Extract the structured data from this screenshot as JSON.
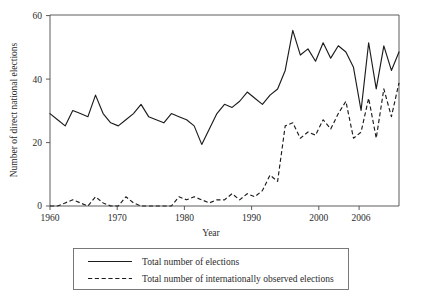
{
  "chart_data": {
    "type": "line",
    "title": "",
    "xlabel": "Year",
    "ylabel": "Number of direct national elections",
    "xlim": [
      1960,
      2006
    ],
    "ylim": [
      0,
      62
    ],
    "grid": false,
    "legend_position": "bottom",
    "xticks": [
      1960,
      1970,
      1980,
      1990,
      2000,
      2006
    ],
    "xtick_labels": [
      "1960",
      "1970",
      "1980",
      "1990",
      "2000",
      "2006"
    ],
    "yticks": [
      0,
      20,
      40,
      60
    ],
    "ytick_labels": [
      "0",
      "20",
      "40",
      "60"
    ],
    "x": [
      1960,
      1961,
      1962,
      1963,
      1964,
      1965,
      1966,
      1967,
      1968,
      1969,
      1970,
      1971,
      1972,
      1973,
      1974,
      1975,
      1976,
      1977,
      1978,
      1979,
      1980,
      1981,
      1982,
      1983,
      1984,
      1985,
      1986,
      1987,
      1988,
      1989,
      1990,
      1991,
      1992,
      1993,
      1994,
      1995,
      1996,
      1997,
      1998,
      1999,
      2000,
      2001,
      2002,
      2003,
      2004,
      2005,
      2006
    ],
    "series": [
      {
        "name": "Total number of  elections",
        "style": "solid",
        "color": "#1c1c1c",
        "values": [
          30,
          28,
          26,
          31,
          30,
          29,
          36,
          30,
          27,
          26,
          28,
          30,
          33,
          29,
          28,
          27,
          30,
          29,
          28,
          26,
          20,
          25,
          30,
          33,
          32,
          34,
          37,
          35,
          33,
          36,
          38,
          44,
          57,
          49,
          51,
          47,
          53,
          48,
          52,
          50,
          45,
          31,
          53,
          38,
          52,
          44,
          50
        ]
      },
      {
        "name": "Total number of  internationally observed elections",
        "style": "dashed",
        "color": "#1c1c1c",
        "values": [
          0,
          0,
          1,
          2,
          1,
          0,
          3,
          1,
          0,
          0,
          3,
          1,
          0,
          0,
          0,
          0,
          0,
          3,
          2,
          3,
          2,
          1,
          2,
          2,
          4,
          2,
          4,
          3,
          5,
          10,
          8,
          26,
          27,
          22,
          24,
          23,
          28,
          25,
          30,
          34,
          22,
          24,
          35,
          22,
          38,
          29,
          40
        ]
      }
    ]
  },
  "legend": {
    "entries": [
      {
        "label": "Total number of  elections",
        "style": "solid"
      },
      {
        "label": "Total number of  internationally observed elections",
        "style": "dashed"
      }
    ]
  },
  "axes": {
    "y_title": "Number of direct national elections",
    "x_title": "Year",
    "y_labels": [
      "60",
      "40",
      "20",
      "0"
    ],
    "x_labels": [
      "1960",
      "1970",
      "1980",
      "1990",
      "2000",
      "2006"
    ]
  }
}
